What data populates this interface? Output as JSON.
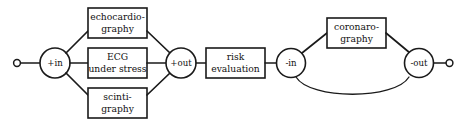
{
  "diagram": {
    "background_color": "#ffffff",
    "line_color": "#1a1a1a",
    "terminals": [
      {
        "name": "start-terminal",
        "label": ""
      },
      {
        "name": "end-terminal",
        "label": ""
      }
    ],
    "nodes": [
      {
        "id": "in_plus",
        "label": "+in"
      },
      {
        "id": "out_plus",
        "label": "+out"
      },
      {
        "id": "in_minus",
        "label": "-in"
      },
      {
        "id": "out_minus",
        "label": "-out"
      }
    ],
    "boxes": [
      {
        "id": "echo",
        "line1": "echocardio-",
        "line2": "graphy"
      },
      {
        "id": "ecg",
        "line1": "ECG",
        "line2": "under stress"
      },
      {
        "id": "scinti",
        "line1": "scinti-",
        "line2": "graphy"
      },
      {
        "id": "risk",
        "line1": "risk",
        "line2": "evaluation"
      },
      {
        "id": "corona",
        "line1": "coronaro-",
        "line2": "graphy"
      }
    ]
  }
}
